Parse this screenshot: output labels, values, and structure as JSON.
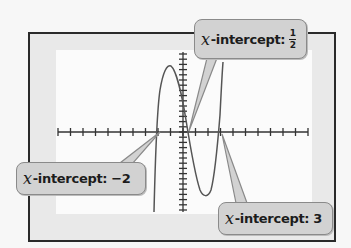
{
  "chart_data": {
    "type": "line",
    "title": "",
    "xlabel": "",
    "ylabel": "",
    "function_shape": "cubic-like polynomial graph on graphing calculator screen",
    "x_intercepts": [
      -2,
      0.5,
      3
    ],
    "x_ticks_count": 20,
    "grid": false,
    "annotations": [
      {
        "text_var": "x",
        "text_label": "-intercept:",
        "value": "1/2",
        "x": 0.5
      },
      {
        "text_var": "x",
        "text_label": "-intercept:",
        "value": "−2",
        "x": -2
      },
      {
        "text_var": "x",
        "text_label": "-intercept:",
        "value": "3",
        "x": 3
      }
    ]
  },
  "callouts": {
    "half": {
      "var": "x",
      "label": "-intercept:",
      "num": "1",
      "den": "2"
    },
    "neg2": {
      "var": "x",
      "label": "-intercept:",
      "value": "−2"
    },
    "three": {
      "var": "x",
      "label": "-intercept:",
      "value": "3"
    }
  },
  "colors": {
    "curve": "#555555",
    "axis": "#333333",
    "callout_fill": "#d2d2d2",
    "frame": "#2a2a2a"
  }
}
